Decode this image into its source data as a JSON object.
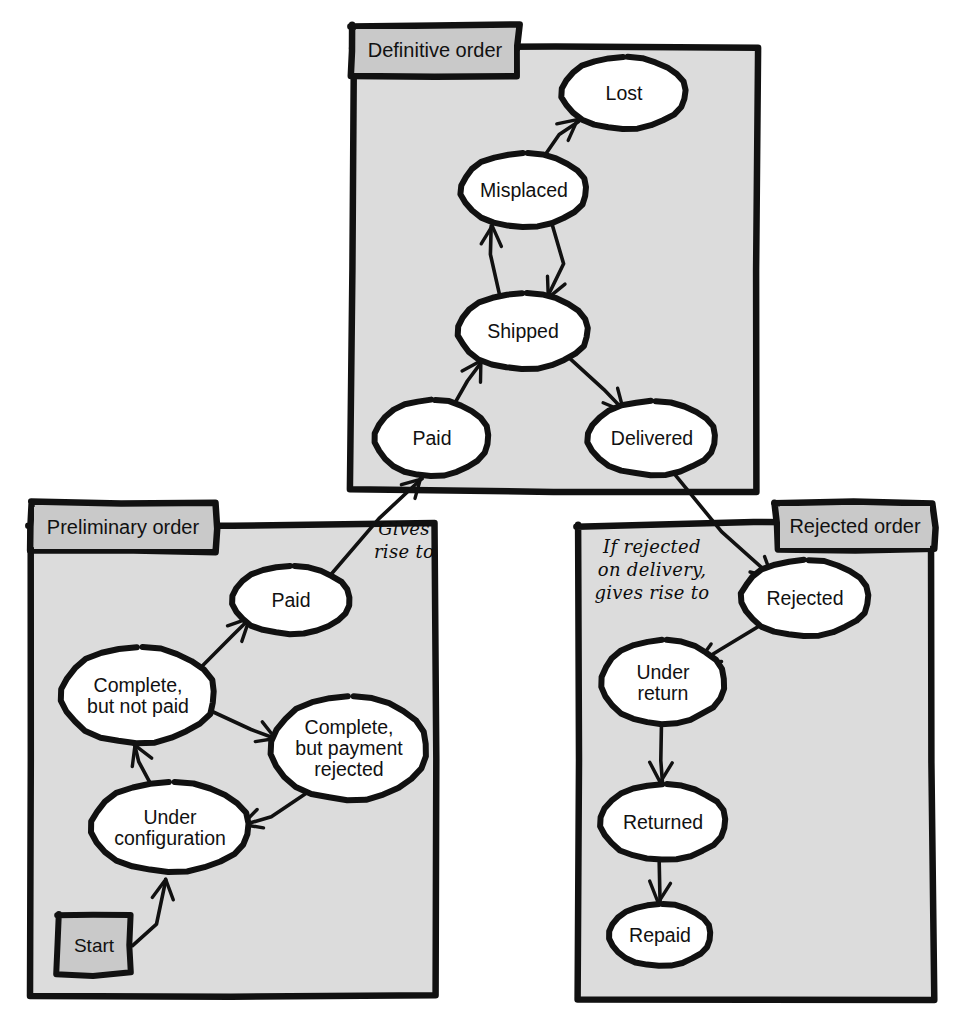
{
  "diagram": {
    "style": "hand-drawn UML state diagram",
    "background_color": "#ffffff",
    "package_fill": "#dcdcdc",
    "tab_fill": "#c9c9c9",
    "node_fill": "#ffffff",
    "stroke_color": "#111111"
  },
  "packages": [
    {
      "id": "definitive",
      "label": "Definitive order",
      "tab_side": "left",
      "box": {
        "x": 352,
        "y": 48,
        "w": 404,
        "h": 442
      },
      "tab": {
        "x": 352,
        "y": 25,
        "w": 166,
        "h": 50
      }
    },
    {
      "id": "preliminary",
      "label": "Preliminary order",
      "tab_side": "left",
      "box": {
        "x": 30,
        "y": 525,
        "w": 406,
        "h": 470
      },
      "tab": {
        "x": 30,
        "y": 503,
        "w": 186,
        "h": 48
      }
    },
    {
      "id": "rejected",
      "label": "Rejected order",
      "tab_side": "right",
      "box": {
        "x": 578,
        "y": 525,
        "w": 355,
        "h": 473
      },
      "tab": {
        "x": 776,
        "y": 502,
        "w": 158,
        "h": 48
      }
    }
  ],
  "states": [
    {
      "id": "d-lost",
      "package": "definitive",
      "label": "Lost",
      "cx": 624,
      "cy": 93,
      "rx": 62,
      "ry": 36
    },
    {
      "id": "d-misplaced",
      "package": "definitive",
      "label": "Misplaced",
      "cx": 524,
      "cy": 190,
      "rx": 63,
      "ry": 37
    },
    {
      "id": "d-shipped",
      "package": "definitive",
      "label": "Shipped",
      "cx": 523,
      "cy": 331,
      "rx": 65,
      "ry": 38
    },
    {
      "id": "d-paid",
      "package": "definitive",
      "label": "Paid",
      "cx": 432,
      "cy": 438,
      "rx": 57,
      "ry": 38
    },
    {
      "id": "d-delivered",
      "package": "definitive",
      "label": "Delivered",
      "cx": 652,
      "cy": 438,
      "rx": 64,
      "ry": 37
    },
    {
      "id": "p-paid",
      "package": "preliminary",
      "label": "Paid",
      "cx": 291,
      "cy": 600,
      "rx": 59,
      "ry": 34
    },
    {
      "id": "p-complete-unpaid",
      "package": "preliminary",
      "label": "Complete,\nbut not paid",
      "cx": 138,
      "cy": 695,
      "rx": 77,
      "ry": 48
    },
    {
      "id": "p-complete-rejected",
      "package": "preliminary",
      "label": "Complete,\nbut payment\nrejected",
      "cx": 349,
      "cy": 748,
      "rx": 78,
      "ry": 52
    },
    {
      "id": "p-under-configuration",
      "package": "preliminary",
      "label": "Under\nconfiguration",
      "cx": 170,
      "cy": 827,
      "rx": 79,
      "ry": 45
    },
    {
      "id": "r-rejected",
      "package": "rejected",
      "label": "Rejected",
      "cx": 805,
      "cy": 598,
      "rx": 64,
      "ry": 38
    },
    {
      "id": "r-under-return",
      "package": "rejected",
      "label": "Under\nreturn",
      "cx": 663,
      "cy": 682,
      "rx": 62,
      "ry": 42
    },
    {
      "id": "r-returned",
      "package": "rejected",
      "label": "Returned",
      "cx": 663,
      "cy": 822,
      "rx": 63,
      "ry": 38
    },
    {
      "id": "r-repaid",
      "package": "rejected",
      "label": "Repaid",
      "cx": 660,
      "cy": 935,
      "rx": 51,
      "ry": 31
    }
  ],
  "start_node": {
    "id": "p-start",
    "package": "preliminary",
    "label": "Start",
    "box": {
      "x": 58,
      "y": 915,
      "w": 72,
      "h": 59
    }
  },
  "notes": [
    {
      "id": "note-gives-rise-to",
      "text": "Gives\nrise to",
      "x": 404,
      "y": 540,
      "align": "center"
    },
    {
      "id": "note-if-rejected",
      "text": "If rejected\non delivery,\ngives rise to",
      "x": 652,
      "y": 570,
      "align": "center"
    }
  ],
  "transitions": [
    {
      "id": "t-misplaced-lost",
      "from": "d-misplaced",
      "to": "d-lost"
    },
    {
      "id": "t-shipped-misplaced",
      "from": "d-shipped",
      "to": "d-misplaced"
    },
    {
      "id": "t-misplaced-shipped",
      "from": "d-misplaced",
      "to": "d-shipped"
    },
    {
      "id": "t-paid-shipped",
      "from": "d-paid",
      "to": "d-shipped"
    },
    {
      "id": "t-shipped-delivered",
      "from": "d-shipped",
      "to": "d-delivered"
    },
    {
      "id": "t-start-underconfig",
      "from": "p-start",
      "to": "p-under-configuration"
    },
    {
      "id": "t-underconfig-complete",
      "from": "p-under-configuration",
      "to": "p-complete-unpaid"
    },
    {
      "id": "t-complete-paid",
      "from": "p-complete-unpaid",
      "to": "p-paid"
    },
    {
      "id": "t-complete-rejected",
      "from": "p-complete-unpaid",
      "to": "p-complete-rejected"
    },
    {
      "id": "t-rejected-underconfig",
      "from": "p-complete-rejected",
      "to": "p-under-configuration"
    },
    {
      "id": "t-ppaid-dpaid",
      "from": "p-paid",
      "to": "d-paid",
      "note": "note-gives-rise-to"
    },
    {
      "id": "t-delivered-rejected",
      "from": "d-delivered",
      "to": "r-rejected",
      "note": "note-if-rejected"
    },
    {
      "id": "t-rejected-underreturn",
      "from": "r-rejected",
      "to": "r-under-return"
    },
    {
      "id": "t-underreturn-returned",
      "from": "r-under-return",
      "to": "r-returned"
    },
    {
      "id": "t-returned-repaid",
      "from": "r-returned",
      "to": "r-repaid"
    }
  ]
}
